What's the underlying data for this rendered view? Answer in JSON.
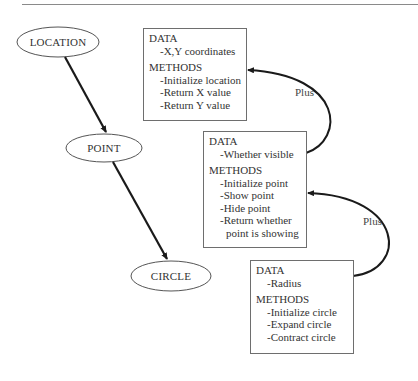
{
  "diagram": {
    "nodes": [
      {
        "id": "location",
        "label": "LOCATION"
      },
      {
        "id": "point",
        "label": "POINT"
      },
      {
        "id": "circle",
        "label": "CIRCLE"
      }
    ],
    "edges": [
      {
        "from": "location",
        "to": "point"
      },
      {
        "from": "point",
        "to": "circle"
      }
    ],
    "boxes": [
      {
        "id": "location-box",
        "data_heading": "DATA",
        "data_items": [
          "-X,Y coordinates"
        ],
        "methods_heading": "METHODS",
        "methods_items": [
          "-Initialize location",
          "-Return X value",
          "-Return Y value"
        ]
      },
      {
        "id": "point-box",
        "data_heading": "DATA",
        "data_items": [
          "-Whether visible"
        ],
        "methods_heading": "METHODS",
        "methods_items": [
          "-Initialize point",
          "-Show point",
          "-Hide point",
          "-Return whether",
          "point is showing"
        ]
      },
      {
        "id": "circle-box",
        "data_heading": "DATA",
        "data_items": [
          "-Radius"
        ],
        "methods_heading": "METHODS",
        "methods_items": [
          "-Initialize circle",
          "-Expand circle",
          "-Contract circle"
        ]
      }
    ],
    "connectors": [
      {
        "from": "point-box",
        "to": "location-box",
        "label": "Plus"
      },
      {
        "from": "circle-box",
        "to": "point-box",
        "label": "Plus"
      }
    ]
  }
}
